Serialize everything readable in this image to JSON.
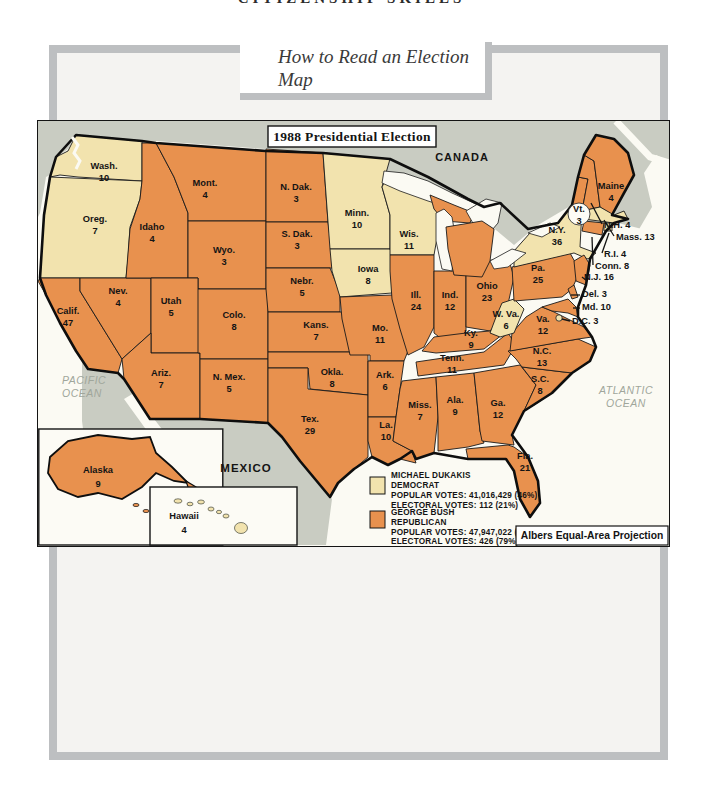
{
  "page": {
    "kicker": "CITIZENSHIP SKILLS",
    "lesson_title": "How to Read an Election Map"
  },
  "map": {
    "title": "1988 Presidential Election",
    "projection_note": "Albers Equal-Area Projection",
    "geo_labels": {
      "canada": "CANADA",
      "mexico": "MEXICO",
      "pacific_line1": "PACIFIC",
      "pacific_line2": "OCEAN",
      "atlantic_line1": "ATLANTIC",
      "atlantic_line2": "OCEAN"
    },
    "colors": {
      "democrat": "#f2e3ae",
      "republican": "#e8914e",
      "foreign_land": "#c9ccc2",
      "ocean": "#fbfaf3",
      "river": "#cdd1c5"
    },
    "legend": [
      {
        "party_key": "democrat",
        "candidate": "MICHAEL DUKAKIS",
        "party": "DEMOCRAT",
        "popular_votes": "POPULAR VOTES: 41,016,429 (46%)",
        "electoral_votes": "ELECTORAL VOTES: 112 (21%)"
      },
      {
        "party_key": "republican",
        "candidate": "GEORGE BUSH",
        "party": "REPUBLICAN",
        "popular_votes": "POPULAR VOTES: 47,947,022 (54%)",
        "electoral_votes": "ELECTORAL VOTES: 426 (79%)"
      }
    ],
    "states": [
      {
        "id": "wa",
        "name": "Wash.",
        "votes": 10,
        "party": "D"
      },
      {
        "id": "or",
        "name": "Oreg.",
        "votes": 7,
        "party": "D"
      },
      {
        "id": "ca",
        "name": "Calif.",
        "votes": 47,
        "party": "R"
      },
      {
        "id": "nv",
        "name": "Nev.",
        "votes": 4,
        "party": "R"
      },
      {
        "id": "id",
        "name": "Idaho",
        "votes": 4,
        "party": "R"
      },
      {
        "id": "mt",
        "name": "Mont.",
        "votes": 4,
        "party": "R"
      },
      {
        "id": "wy",
        "name": "Wyo.",
        "votes": 3,
        "party": "R"
      },
      {
        "id": "ut",
        "name": "Utah",
        "votes": 5,
        "party": "R"
      },
      {
        "id": "az",
        "name": "Ariz.",
        "votes": 7,
        "party": "R"
      },
      {
        "id": "nm",
        "name": "N. Mex.",
        "votes": 5,
        "party": "R"
      },
      {
        "id": "co",
        "name": "Colo.",
        "votes": 8,
        "party": "R"
      },
      {
        "id": "nd",
        "name": "N. Dak.",
        "votes": 3,
        "party": "R"
      },
      {
        "id": "sd",
        "name": "S. Dak.",
        "votes": 3,
        "party": "R"
      },
      {
        "id": "ne",
        "name": "Nebr.",
        "votes": 5,
        "party": "R"
      },
      {
        "id": "ks",
        "name": "Kans.",
        "votes": 7,
        "party": "R"
      },
      {
        "id": "ok",
        "name": "Okla.",
        "votes": 8,
        "party": "R"
      },
      {
        "id": "tx",
        "name": "Tex.",
        "votes": 29,
        "party": "R"
      },
      {
        "id": "mn",
        "name": "Minn.",
        "votes": 10,
        "party": "D"
      },
      {
        "id": "ia",
        "name": "Iowa",
        "votes": 8,
        "party": "D"
      },
      {
        "id": "mo",
        "name": "Mo.",
        "votes": 11,
        "party": "R"
      },
      {
        "id": "ar",
        "name": "Ark.",
        "votes": 6,
        "party": "R"
      },
      {
        "id": "la",
        "name": "La.",
        "votes": 10,
        "party": "R"
      },
      {
        "id": "wi",
        "name": "Wis.",
        "votes": 11,
        "party": "D"
      },
      {
        "id": "il",
        "name": "Ill.",
        "votes": 24,
        "party": "R"
      },
      {
        "id": "mi",
        "name": "Mich.",
        "votes": 20,
        "party": "R"
      },
      {
        "id": "in",
        "name": "Ind.",
        "votes": 12,
        "party": "R"
      },
      {
        "id": "oh",
        "name": "Ohio",
        "votes": 23,
        "party": "R"
      },
      {
        "id": "ky",
        "name": "Ky.",
        "votes": 9,
        "party": "R"
      },
      {
        "id": "tn",
        "name": "Tenn.",
        "votes": 11,
        "party": "R"
      },
      {
        "id": "ms",
        "name": "Miss.",
        "votes": 7,
        "party": "R"
      },
      {
        "id": "al",
        "name": "Ala.",
        "votes": 9,
        "party": "R"
      },
      {
        "id": "ga",
        "name": "Ga.",
        "votes": 12,
        "party": "R"
      },
      {
        "id": "fl",
        "name": "Fla.",
        "votes": 21,
        "party": "R"
      },
      {
        "id": "sc",
        "name": "S.C.",
        "votes": 8,
        "party": "R"
      },
      {
        "id": "nc",
        "name": "N.C.",
        "votes": 13,
        "party": "R"
      },
      {
        "id": "va",
        "name": "Va.",
        "votes": 12,
        "party": "R"
      },
      {
        "id": "wv",
        "name": "W. Va.",
        "votes": 6,
        "party": "D"
      },
      {
        "id": "pa",
        "name": "Pa.",
        "votes": 25,
        "party": "R"
      },
      {
        "id": "ny",
        "name": "N.Y.",
        "votes": 36,
        "party": "D"
      },
      {
        "id": "vt",
        "name": "Vt.",
        "votes": 3,
        "party": "R"
      },
      {
        "id": "me",
        "name": "Maine",
        "votes": 4,
        "party": "R"
      },
      {
        "id": "nh",
        "name": "N.H.",
        "votes": 4,
        "party": "R"
      },
      {
        "id": "ma",
        "name": "Mass.",
        "votes": 13,
        "party": "D"
      },
      {
        "id": "ri",
        "name": "R.I.",
        "votes": 4,
        "party": "D"
      },
      {
        "id": "ct",
        "name": "Conn.",
        "votes": 8,
        "party": "R"
      },
      {
        "id": "nj",
        "name": "N.J.",
        "votes": 16,
        "party": "R"
      },
      {
        "id": "de",
        "name": "Del.",
        "votes": 3,
        "party": "R"
      },
      {
        "id": "md",
        "name": "Md.",
        "votes": 10,
        "party": "R"
      },
      {
        "id": "dc",
        "name": "D.C.",
        "votes": 3,
        "party": "D"
      },
      {
        "id": "ak",
        "name": "Alaska",
        "votes": 9,
        "party": "R"
      },
      {
        "id": "hi",
        "name": "Hawaii",
        "votes": 4,
        "party": "D"
      }
    ]
  }
}
